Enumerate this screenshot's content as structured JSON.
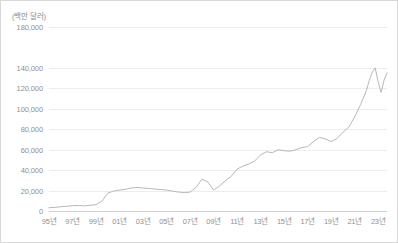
{
  "chart_data": {
    "type": "line",
    "title": "",
    "subtitle": "",
    "unit_label": "(백만 달러)",
    "xlabel": "",
    "ylabel": "",
    "grid": true,
    "legend": false,
    "legend_position": "none",
    "line_color": "#b8b8b8",
    "grid_color": "#ededed",
    "axis_color": "#cfcfcf",
    "text_color": "#909090",
    "ylim": [
      0,
      180000
    ],
    "ytick_labels": [
      "180,000",
      "140,000",
      "120,000",
      "100,000",
      "80,000",
      "60,000",
      "40,000",
      "20,000",
      "0"
    ],
    "ytick_values": [
      180000,
      140000,
      120000,
      100000,
      80000,
      60000,
      40000,
      20000,
      0
    ],
    "xtick_labels": [
      "95년",
      "97년",
      "99년",
      "01년",
      "03년",
      "05년",
      "07년",
      "09년",
      "11년",
      "13년",
      "15년",
      "17년",
      "19년",
      "21년",
      "23년"
    ],
    "xtick_values": [
      1995,
      1997,
      1999,
      2001,
      2003,
      2005,
      2007,
      2009,
      2011,
      2013,
      2015,
      2017,
      2019,
      2021,
      2023
    ],
    "xlim": [
      1995,
      2023.75
    ],
    "x": [
      1995,
      1995.5,
      1996,
      1996.5,
      1997,
      1997.5,
      1998,
      1998.5,
      1999,
      1999.5,
      2000,
      2000.5,
      2001,
      2001.5,
      2002,
      2002.5,
      2003,
      2003.5,
      2004,
      2004.5,
      2005,
      2005.5,
      2006,
      2006.5,
      2007,
      2007.5,
      2008,
      2008.5,
      2009,
      2009.5,
      2010,
      2010.5,
      2011,
      2011.5,
      2012,
      2012.5,
      2013,
      2013.5,
      2014,
      2014.5,
      2015,
      2015.5,
      2016,
      2016.5,
      2017,
      2017.5,
      2018,
      2018.5,
      2019,
      2019.5,
      2020,
      2020.5,
      2021,
      2021.5,
      2022,
      2022.25,
      2022.5,
      2022.75,
      2023,
      2023.25,
      2023.5,
      2023.75
    ],
    "values": [
      3200,
      3500,
      4200,
      4600,
      5200,
      5400,
      5000,
      5600,
      6200,
      9500,
      17500,
      19500,
      20500,
      21200,
      22500,
      23000,
      22500,
      22000,
      21500,
      21000,
      20500,
      19500,
      18500,
      18000,
      18500,
      23000,
      31000,
      28500,
      20500,
      24500,
      29500,
      34000,
      41000,
      44000,
      46000,
      49000,
      55000,
      58000,
      57000,
      60000,
      59000,
      58500,
      60000,
      62000,
      63000,
      68000,
      72000,
      70500,
      68000,
      71000,
      77000,
      82000,
      92000,
      104000,
      118000,
      128000,
      136000,
      140000,
      126000,
      116000,
      128000,
      135000
    ]
  }
}
